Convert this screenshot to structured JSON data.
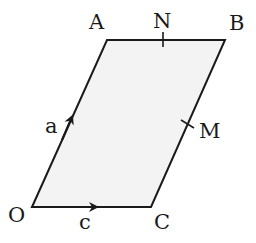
{
  "diagram": {
    "type": "parallelogram-vectors",
    "colors": {
      "fill": "#f3f3f3",
      "stroke": "#1a1a1a",
      "background": "#ffffff"
    },
    "vertices": {
      "O": {
        "label": "O"
      },
      "A": {
        "label": "A"
      },
      "B": {
        "label": "B"
      },
      "C": {
        "label": "C"
      }
    },
    "midpoints": {
      "N": {
        "label": "N",
        "on_side": "AB"
      },
      "M": {
        "label": "M",
        "on_side": "BC"
      }
    },
    "vectors": {
      "OA": {
        "label": "a"
      },
      "OC": {
        "label": "c"
      }
    }
  }
}
